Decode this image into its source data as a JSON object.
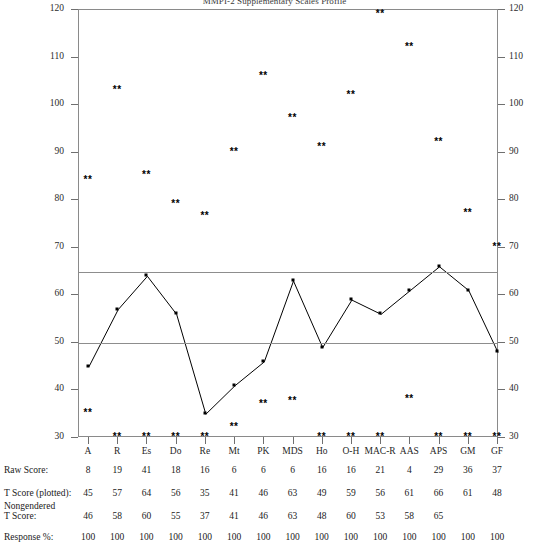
{
  "title": "MMPI-2 Supplementary Scales Profile",
  "chart_data": {
    "type": "line",
    "title": "MMPI-2 Supplementary Scales Profile",
    "xlabel": "",
    "ylabel": "",
    "ylim": [
      30,
      120
    ],
    "yticks": [
      30,
      40,
      50,
      60,
      70,
      80,
      90,
      100,
      110,
      120
    ],
    "grid": false,
    "legend": "none",
    "reference_lines": [
      50,
      65
    ],
    "categories": [
      "A",
      "R",
      "Es",
      "Do",
      "Re",
      "Mt",
      "PK",
      "MDS",
      "Ho",
      "O-H",
      "MAC-R",
      "AAS",
      "APS",
      "GM",
      "GF"
    ],
    "series": [
      {
        "name": "T Score (plotted)",
        "values": [
          45,
          57,
          64,
          56,
          35,
          41,
          46,
          63,
          49,
          59,
          56,
          61,
          66,
          61,
          48
        ]
      }
    ],
    "annotations": {
      "marker_symbol": "**",
      "upper_marker_values": [
        84,
        103,
        85,
        79,
        76.5,
        90,
        106,
        97,
        91,
        102,
        119,
        112,
        92,
        77,
        70
      ],
      "lower_marker_values": [
        35,
        30,
        30,
        30,
        30,
        32,
        37,
        37.5,
        30,
        30,
        30,
        38,
        30,
        30,
        30
      ]
    }
  },
  "axis": {
    "left_ticks": [
      "120",
      "110",
      "100",
      "90",
      "80",
      "70",
      "60",
      "50",
      "40",
      "30"
    ],
    "right_ticks": [
      "120",
      "110",
      "100",
      "90",
      "80",
      "70",
      "60",
      "50",
      "40",
      "30"
    ]
  },
  "table": {
    "row_labels": {
      "raw_score": "Raw Score:",
      "t_score": "T Score (plotted):",
      "nongendered_line1": "Nongendered",
      "nongendered_line2": "T Score:",
      "response_pct": "Response %:"
    },
    "scales": [
      "A",
      "R",
      "Es",
      "Do",
      "Re",
      "Mt",
      "PK",
      "MDS",
      "Ho",
      "O-H",
      "MAC-R",
      "AAS",
      "APS",
      "GM",
      "GF"
    ],
    "raw_score": [
      "8",
      "19",
      "41",
      "18",
      "16",
      "6",
      "6",
      "6",
      "16",
      "16",
      "21",
      "4",
      "29",
      "36",
      "37"
    ],
    "t_score": [
      "45",
      "57",
      "64",
      "56",
      "35",
      "41",
      "46",
      "63",
      "49",
      "59",
      "56",
      "61",
      "66",
      "61",
      "48"
    ],
    "nongendered_t_score": [
      "46",
      "58",
      "60",
      "55",
      "37",
      "41",
      "46",
      "63",
      "48",
      "60",
      "53",
      "58",
      "65",
      "",
      ""
    ],
    "response_pct": [
      "100",
      "100",
      "100",
      "100",
      "100",
      "100",
      "100",
      "100",
      "100",
      "100",
      "100",
      "100",
      "100",
      "100",
      "100"
    ]
  },
  "colors": {
    "line": "#000000",
    "frame": "#8a8a8a",
    "reference": "#8d8d8d",
    "text": "#1a1a1a"
  }
}
